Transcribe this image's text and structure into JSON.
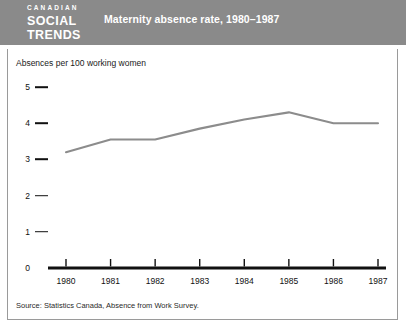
{
  "header": {
    "brand_line1": "CANADIAN",
    "brand_line2": "SOCIAL",
    "brand_line3": "TRENDS",
    "title": "Maternity absence rate, 1980–1987",
    "background_color": "#8a8a8a",
    "text_color": "#ffffff"
  },
  "footer": {
    "source": "Source: Statistics Canada, Absence from Work Survey."
  },
  "colors": {
    "line": "#8c8c8c",
    "axis": "#111111",
    "frame": "#9a9a9a",
    "background": "#ffffff"
  },
  "chart_data": {
    "type": "line",
    "title": "Maternity absence rate, 1980–1987",
    "subtitle": "",
    "xlabel": "",
    "ylabel": "Absences per 100 working women",
    "categories": [
      "1980",
      "1981",
      "1982",
      "1983",
      "1984",
      "1985",
      "1986",
      "1987"
    ],
    "x": [
      1980,
      1981,
      1982,
      1983,
      1984,
      1985,
      1986,
      1987
    ],
    "values": [
      3.2,
      3.55,
      3.55,
      3.85,
      4.1,
      4.3,
      4.0,
      4.0
    ],
    "series": [
      {
        "name": "Maternity absence rate",
        "values": [
          3.2,
          3.55,
          3.55,
          3.85,
          4.1,
          4.3,
          4.0,
          4.0
        ]
      }
    ],
    "ylim": [
      0,
      5
    ],
    "yticks": [
      0,
      1,
      2,
      3,
      4,
      5
    ],
    "ytick_labels": [
      "0",
      "1",
      "2",
      "3",
      "4",
      "5"
    ],
    "xtick_labels": [
      "1980",
      "1981",
      "1982",
      "1983",
      "1984",
      "1985",
      "1986",
      "1987"
    ],
    "grid": false,
    "legend": false,
    "legend_position": "none",
    "line_color": "#8c8c8c",
    "annotations": []
  }
}
